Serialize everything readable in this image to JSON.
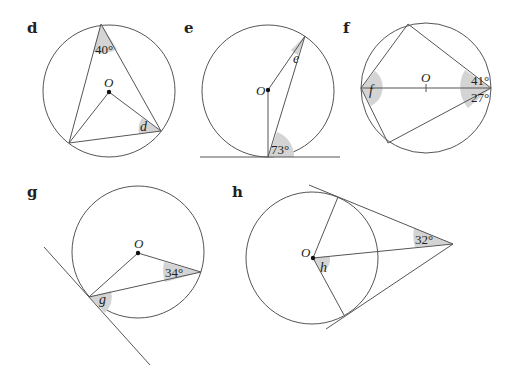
{
  "diagrams": {
    "d": {
      "label": "d",
      "given_angle": "40°",
      "unknown": "d",
      "center": "O"
    },
    "e": {
      "label": "e",
      "given_angle": "73°",
      "unknown": "e",
      "center": "O"
    },
    "f": {
      "label": "f",
      "given_angle_top": "41°",
      "given_angle_bottom": "27°",
      "unknown": "f",
      "center": "O"
    },
    "g": {
      "label": "g",
      "given_angle": "34°",
      "unknown": "g",
      "center": "O"
    },
    "h": {
      "label": "h",
      "given_angle": "32°",
      "unknown": "h",
      "center": "O"
    }
  },
  "colors": {
    "line": "#555555",
    "shade": "#d4d4d4",
    "text": "#231f20"
  }
}
